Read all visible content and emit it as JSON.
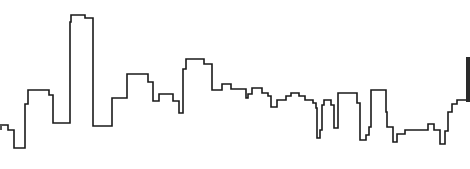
{
  "image": {
    "subject": "City skyline outline drawing",
    "description": "Single continuous black stepped line tracing the silhouette of a city skyline on white background",
    "background_color": "#ffffff",
    "stroke_color": "#1a1a1a",
    "stroke_width": 1.6
  },
  "skyline": {
    "points": [
      [
        0,
        125
      ],
      [
        8,
        125
      ],
      [
        8,
        130
      ],
      [
        14,
        130
      ],
      [
        14,
        148
      ],
      [
        25,
        148
      ],
      [
        25,
        104
      ],
      [
        28,
        104
      ],
      [
        28,
        90
      ],
      [
        49,
        90
      ],
      [
        49,
        95
      ],
      [
        53,
        95
      ],
      [
        53,
        123
      ],
      [
        70,
        123
      ],
      [
        70,
        22
      ],
      [
        71,
        22
      ],
      [
        71,
        15
      ],
      [
        85,
        15
      ],
      [
        85,
        18
      ],
      [
        93,
        18
      ],
      [
        93,
        126
      ],
      [
        112,
        126
      ],
      [
        112,
        98
      ],
      [
        127,
        98
      ],
      [
        127,
        74
      ],
      [
        148,
        74
      ],
      [
        148,
        82
      ],
      [
        153,
        82
      ],
      [
        153,
        101
      ],
      [
        159,
        101
      ],
      [
        159,
        94
      ],
      [
        173,
        94
      ],
      [
        173,
        101
      ],
      [
        179,
        101
      ],
      [
        179,
        113
      ],
      [
        183,
        113
      ],
      [
        183,
        69
      ],
      [
        186,
        69
      ],
      [
        186,
        59
      ],
      [
        204,
        59
      ],
      [
        204,
        64
      ],
      [
        212,
        64
      ],
      [
        212,
        90
      ],
      [
        222,
        90
      ],
      [
        222,
        84
      ],
      [
        231,
        84
      ],
      [
        231,
        89
      ],
      [
        246,
        89
      ],
      [
        246,
        98
      ],
      [
        248,
        98
      ],
      [
        248,
        94
      ],
      [
        252,
        94
      ],
      [
        252,
        88
      ],
      [
        262,
        88
      ],
      [
        262,
        93
      ],
      [
        268,
        93
      ],
      [
        268,
        96
      ],
      [
        271,
        96
      ],
      [
        271,
        107
      ],
      [
        277,
        107
      ],
      [
        277,
        100
      ],
      [
        286,
        100
      ],
      [
        286,
        96
      ],
      [
        291,
        96
      ],
      [
        291,
        93
      ],
      [
        299,
        93
      ],
      [
        299,
        96
      ],
      [
        305,
        96
      ],
      [
        305,
        100
      ],
      [
        313,
        100
      ],
      [
        313,
        103
      ],
      [
        316,
        103
      ],
      [
        316,
        108
      ],
      [
        317,
        108
      ],
      [
        317,
        138
      ],
      [
        320,
        138
      ],
      [
        320,
        130
      ],
      [
        322,
        130
      ],
      [
        322,
        105
      ],
      [
        324,
        105
      ],
      [
        324,
        100
      ],
      [
        331,
        100
      ],
      [
        331,
        105
      ],
      [
        334,
        105
      ],
      [
        334,
        128
      ],
      [
        338,
        128
      ],
      [
        338,
        93
      ],
      [
        357,
        93
      ],
      [
        357,
        103
      ],
      [
        360,
        103
      ],
      [
        360,
        140
      ],
      [
        366,
        140
      ],
      [
        366,
        135
      ],
      [
        369,
        135
      ],
      [
        369,
        127
      ],
      [
        371,
        127
      ],
      [
        371,
        90
      ],
      [
        386,
        90
      ],
      [
        386,
        112
      ],
      [
        387,
        112
      ],
      [
        387,
        127
      ],
      [
        393,
        127
      ],
      [
        393,
        142
      ],
      [
        397,
        142
      ],
      [
        397,
        134
      ],
      [
        405,
        134
      ],
      [
        405,
        130
      ],
      [
        428,
        130
      ],
      [
        428,
        124
      ],
      [
        434,
        124
      ],
      [
        434,
        130
      ],
      [
        440,
        130
      ],
      [
        440,
        144
      ],
      [
        445,
        144
      ],
      [
        445,
        131
      ],
      [
        448,
        131
      ],
      [
        448,
        112
      ],
      [
        452,
        112
      ],
      [
        452,
        104
      ],
      [
        457,
        104
      ],
      [
        457,
        100
      ],
      [
        466,
        100
      ]
    ],
    "left_edge_mark": {
      "x": 0,
      "y": 124,
      "width": 2,
      "height": 6
    },
    "right_edge_bar": {
      "x": 466,
      "y": 57,
      "width": 4,
      "height": 45
    }
  }
}
